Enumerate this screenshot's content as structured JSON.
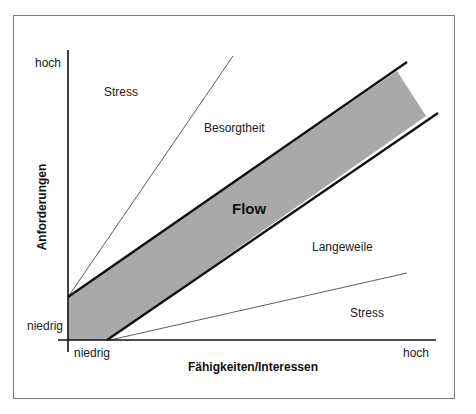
{
  "diagram": {
    "y_axis": {
      "label": "Anforderungen",
      "low": "niedrig",
      "high": "hoch"
    },
    "x_axis": {
      "label": "Fähigkeiten/Interessen",
      "low": "niedrig",
      "high": "hoch"
    },
    "regions": {
      "stress_top": "Stress",
      "worry": "Besorgtheit",
      "flow": "Flow",
      "boredom": "Langeweile",
      "stress_bottom": "Stress"
    },
    "colors": {
      "flow_band": "#a9a9a9",
      "axis": "#111111",
      "frame": "#777777",
      "text": "#222222"
    }
  }
}
